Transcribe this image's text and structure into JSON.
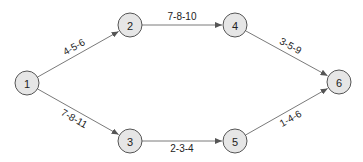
{
  "diagram": {
    "type": "directed-network",
    "colors": {
      "background": "#ffffff",
      "node_fill": "#e6e6e6",
      "node_stroke": "#555555",
      "edge": "#7a7a7a",
      "text": "#222222"
    },
    "node_radius": 12,
    "nodes": [
      {
        "id": "1",
        "label": "1",
        "x": 27,
        "y": 83
      },
      {
        "id": "2",
        "label": "2",
        "x": 130,
        "y": 25
      },
      {
        "id": "3",
        "label": "3",
        "x": 130,
        "y": 141
      },
      {
        "id": "4",
        "label": "4",
        "x": 235,
        "y": 25
      },
      {
        "id": "5",
        "label": "5",
        "x": 235,
        "y": 141
      },
      {
        "id": "6",
        "label": "6",
        "x": 339,
        "y": 82
      }
    ],
    "edges": [
      {
        "from": "1",
        "to": "2",
        "label": "4-5-6",
        "side": -1
      },
      {
        "from": "1",
        "to": "3",
        "label": "7-8-11",
        "side": 1
      },
      {
        "from": "2",
        "to": "4",
        "label": "7-8-10",
        "side": -1
      },
      {
        "from": "3",
        "to": "5",
        "label": "2-3-4",
        "side": 1
      },
      {
        "from": "4",
        "to": "6",
        "label": "3-5-9",
        "side": -1
      },
      {
        "from": "5",
        "to": "6",
        "label": "1-4-6",
        "side": 1
      }
    ]
  }
}
